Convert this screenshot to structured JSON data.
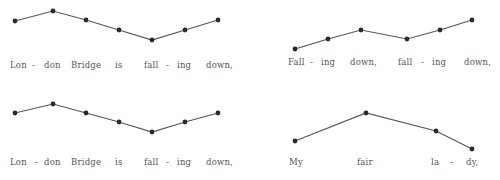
{
  "style": {
    "line_color": "#555555",
    "dot_color": "#2a2a2a",
    "text_color": "#555555"
  },
  "panels": [
    {
      "id": "panel-1",
      "points": [
        [
          15,
          21
        ],
        [
          53,
          11
        ],
        [
          86,
          20
        ],
        [
          119,
          30
        ],
        [
          152,
          40
        ],
        [
          185,
          30
        ],
        [
          218,
          20
        ]
      ],
      "text_y": 60,
      "words": [
        {
          "text": "Lon",
          "x": 10
        },
        {
          "text": "-",
          "x": 32
        },
        {
          "text": "don",
          "x": 44
        },
        {
          "text": "Bridge",
          "x": 71
        },
        {
          "text": "is",
          "x": 115
        },
        {
          "text": "fall",
          "x": 144
        },
        {
          "text": "-",
          "x": 166
        },
        {
          "text": "ing",
          "x": 177
        },
        {
          "text": "down,",
          "x": 206
        }
      ]
    },
    {
      "id": "panel-2",
      "points": [
        [
          295,
          49
        ],
        [
          328,
          39
        ],
        [
          361,
          30
        ],
        [
          407,
          39
        ],
        [
          440,
          30
        ],
        [
          472,
          20
        ]
      ],
      "text_y": 57,
      "words": [
        {
          "text": "Fall",
          "x": 288
        },
        {
          "text": "-",
          "x": 310
        },
        {
          "text": "ing",
          "x": 321
        },
        {
          "text": "down,",
          "x": 350
        },
        {
          "text": "fall",
          "x": 398
        },
        {
          "text": "-",
          "x": 421
        },
        {
          "text": "ing",
          "x": 432
        },
        {
          "text": "down,",
          "x": 464
        }
      ]
    },
    {
      "id": "panel-3",
      "points": [
        [
          15,
          113
        ],
        [
          53,
          104
        ],
        [
          86,
          113
        ],
        [
          119,
          122
        ],
        [
          152,
          132
        ],
        [
          185,
          122
        ],
        [
          218,
          113
        ]
      ],
      "text_y": 157,
      "words": [
        {
          "text": "Lon",
          "x": 10
        },
        {
          "text": "-",
          "x": 35
        },
        {
          "text": "don",
          "x": 44
        },
        {
          "text": "Bridge",
          "x": 71
        },
        {
          "text": "is",
          "x": 115
        },
        {
          "text": "fall",
          "x": 144
        },
        {
          "text": "-",
          "x": 166
        },
        {
          "text": "ing",
          "x": 177
        },
        {
          "text": "down,",
          "x": 206
        }
      ]
    },
    {
      "id": "panel-4",
      "points": [
        [
          295,
          141
        ],
        [
          366,
          113
        ],
        [
          436,
          131
        ],
        [
          472,
          149
        ]
      ],
      "text_y": 157,
      "words": [
        {
          "text": "My",
          "x": 289
        },
        {
          "text": "fair",
          "x": 357
        },
        {
          "text": "la",
          "x": 431
        },
        {
          "text": "-",
          "x": 450
        },
        {
          "text": "dy,",
          "x": 466
        }
      ]
    }
  ]
}
